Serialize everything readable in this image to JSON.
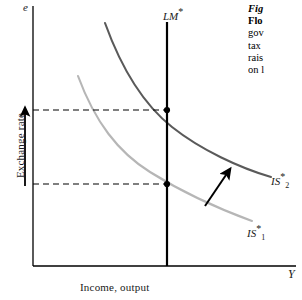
{
  "figure": {
    "type": "economics-diagram",
    "model": "Mundell-Fleming",
    "background_color": "#ffffff"
  },
  "axes": {
    "y_variable": "e",
    "y_title": "Exchange rate",
    "x_variable": "Y",
    "x_title": "Income, output",
    "axis_color": "#000000"
  },
  "curves": {
    "lm": {
      "label_main": "LM",
      "label_star": "*",
      "color": "#000000"
    },
    "is2": {
      "label_main": "IS",
      "label_star": "*",
      "label_sub": "2",
      "color": "#5a5a5a"
    },
    "is1": {
      "label_main": "IS",
      "label_star": "*",
      "label_sub": "1",
      "color": "#b0b0b0"
    }
  },
  "annotations": {
    "shift_arrow_color": "#000000",
    "exchange_rate_arrow_color": "#000000",
    "dashed_line_color": "#000000",
    "equilibrium_dot_color": "#000000"
  },
  "caption": {
    "lines": [
      {
        "text": "Fig",
        "style": "fig"
      },
      {
        "text": "Flo",
        "style": "bold"
      },
      {
        "text": "gov",
        "style": "normal"
      },
      {
        "text": "tax",
        "style": "normal"
      },
      {
        "text": "rais",
        "style": "normal"
      },
      {
        "text": "on l",
        "style": "normal"
      }
    ]
  },
  "chart_data": {
    "type": "line",
    "title": "",
    "xlabel": "Income, output",
    "ylabel": "Exchange rate",
    "xlim": [
      0,
      100
    ],
    "ylim": [
      0,
      100
    ],
    "grid": false,
    "legend": "inline-curve-labels",
    "series": [
      {
        "name": "LM*",
        "kind": "vertical-line",
        "x": 51,
        "y_from": 2,
        "y_to": 100
      },
      {
        "name": "IS*2",
        "kind": "hyperbola",
        "points": [
          [
            27,
            8
          ],
          [
            34,
            22
          ],
          [
            43,
            33
          ],
          [
            51,
            40
          ],
          [
            60,
            48
          ],
          [
            70,
            54
          ],
          [
            80,
            58
          ],
          [
            90,
            62
          ]
        ]
      },
      {
        "name": "IS*1",
        "kind": "hyperbola",
        "points": [
          [
            17,
            28
          ],
          [
            24,
            44
          ],
          [
            33,
            56
          ],
          [
            43,
            64
          ],
          [
            51,
            68
          ],
          [
            62,
            74
          ],
          [
            72,
            78
          ],
          [
            82,
            81
          ]
        ]
      }
    ],
    "equilibria": [
      {
        "name": "new-equilibrium",
        "x": 51,
        "y": 40
      },
      {
        "name": "initial-equilibrium",
        "x": 51,
        "y": 68
      }
    ],
    "annotations": [
      {
        "kind": "arrow",
        "label": "IS shift right",
        "from": [
          60,
          75
        ],
        "to": [
          68,
          59
        ]
      },
      {
        "kind": "arrow",
        "label": "exchange rate rises",
        "from": [
          2,
          68
        ],
        "to": [
          2,
          40
        ]
      }
    ]
  }
}
